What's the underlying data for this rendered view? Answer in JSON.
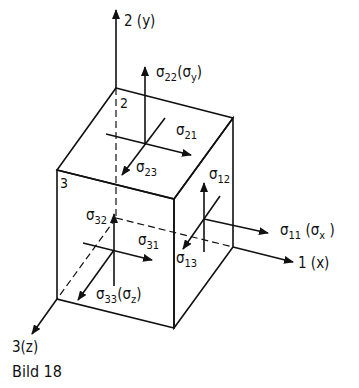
{
  "figure": {
    "caption": "Bild 18"
  },
  "axes": {
    "x": {
      "label": "1 (x)"
    },
    "y": {
      "label": "2 (y)"
    },
    "z": {
      "label": "3(z)"
    }
  },
  "corner_labels": {
    "top_back": "2",
    "front_left": "3"
  },
  "stresses": {
    "s22": {
      "sym": "σ",
      "sub": "22",
      "suffix": "(σ",
      "suffix_sub": "y",
      "close": ")"
    },
    "s21": {
      "sym": "σ",
      "sub": "21"
    },
    "s23": {
      "sym": "σ",
      "sub": "23"
    },
    "s12": {
      "sym": "σ",
      "sub": "12"
    },
    "s11": {
      "sym": "σ",
      "sub": "11",
      "suffix": " (σ",
      "suffix_sub": "x",
      "close": " )"
    },
    "s13": {
      "sym": "σ",
      "sub": "13"
    },
    "s32": {
      "sym": "σ",
      "sub": "32"
    },
    "s31": {
      "sym": "σ",
      "sub": "31"
    },
    "s33": {
      "sym": "σ",
      "sub": "33",
      "suffix": "(σ",
      "suffix_sub": "z",
      "close": ")"
    }
  },
  "colors": {
    "ink": "#111111",
    "background": "#ffffff"
  }
}
